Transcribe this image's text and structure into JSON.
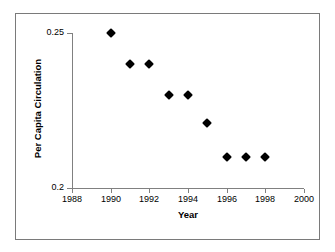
{
  "chart_data": {
    "type": "scatter",
    "title": "",
    "xlabel": "Year",
    "ylabel": "Per Capita Circulation",
    "xlim": [
      1988,
      2000
    ],
    "ylim": [
      0.2,
      0.25
    ],
    "grid": false,
    "legend": null,
    "xticks": [
      1988,
      1990,
      1992,
      1994,
      1996,
      1998,
      2000
    ],
    "xtick_labels": [
      "1988",
      "1990",
      "1992",
      "1994",
      "1996",
      "1998",
      "2000"
    ],
    "yticks": [
      0.2,
      0.25
    ],
    "ytick_labels": [
      "0.2",
      "0.25"
    ],
    "marker": "filled-diamond",
    "marker_color": "#000000",
    "series": [
      {
        "name": "Per Capita Circulation",
        "x": [
          1990,
          1991,
          1992,
          1993,
          1994,
          1995,
          1996,
          1997,
          1998
        ],
        "values": [
          0.25,
          0.24,
          0.24,
          0.23,
          0.23,
          0.221,
          0.21,
          0.21,
          0.21
        ]
      }
    ],
    "points": [
      {
        "x": 1990,
        "y": 0.25
      },
      {
        "x": 1991,
        "y": 0.24
      },
      {
        "x": 1992,
        "y": 0.24
      },
      {
        "x": 1993,
        "y": 0.23
      },
      {
        "x": 1994,
        "y": 0.23
      },
      {
        "x": 1995,
        "y": 0.221
      },
      {
        "x": 1996,
        "y": 0.21
      },
      {
        "x": 1997,
        "y": 0.21
      },
      {
        "x": 1998,
        "y": 0.21
      }
    ]
  },
  "axes": {
    "x_title": "Year",
    "y_title": "Per Capita Circulation",
    "y_top_label": "0.25",
    "y_bottom_label": "0.2"
  },
  "colors": {
    "frame": "#7a7a7a",
    "axis": "#808080",
    "marker": "#000000",
    "text": "#000000",
    "background": "#ffffff"
  }
}
